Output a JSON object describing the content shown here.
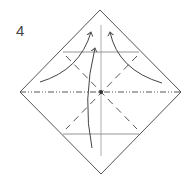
{
  "diagram": {
    "type": "origami-instruction",
    "step_number": "4",
    "paper": {
      "shape": "square rotated 45° (diamond)",
      "corners": {
        "top": [
          100,
          10
        ],
        "right": [
          181,
          92
        ],
        "bottom": [
          101,
          174
        ],
        "left": [
          20,
          92
        ]
      }
    },
    "lines": {
      "horizontal_mountain_fold": {
        "style": "dash-dot-dot",
        "from": [
          20,
          92
        ],
        "to": [
          181,
          92
        ]
      },
      "vertical_crease": {
        "style": "solid thin",
        "from": [
          101,
          25
        ],
        "to": [
          101,
          156
        ]
      },
      "upper_crease": {
        "style": "solid",
        "y": 52,
        "x_from": 63,
        "x_to": 139
      },
      "lower_crease": {
        "style": "solid",
        "y": 134,
        "x_from": 63,
        "x_to": 139
      },
      "diagonal_valley_folds": [
        {
          "style": "dashed",
          "from": [
            66,
            56
          ],
          "to": [
            137,
            129
          ]
        },
        {
          "style": "dashed",
          "from": [
            137,
            56
          ],
          "to": [
            66,
            129
          ]
        }
      ]
    },
    "center_mark": {
      "position": [
        101,
        92
      ]
    },
    "arrows": [
      {
        "name": "left-flap-arrow",
        "from": [
          40,
          82
        ],
        "to": [
          91,
          32
        ]
      },
      {
        "name": "right-flap-arrow",
        "from": [
          162,
          83
        ],
        "to": [
          110,
          32
        ]
      },
      {
        "name": "bottom-flap-arrow",
        "from": [
          92,
          148
        ],
        "to": [
          95,
          48
        ]
      }
    ],
    "colors": {
      "line": "#555555",
      "crease": "#888888",
      "background": "#ffffff"
    }
  }
}
